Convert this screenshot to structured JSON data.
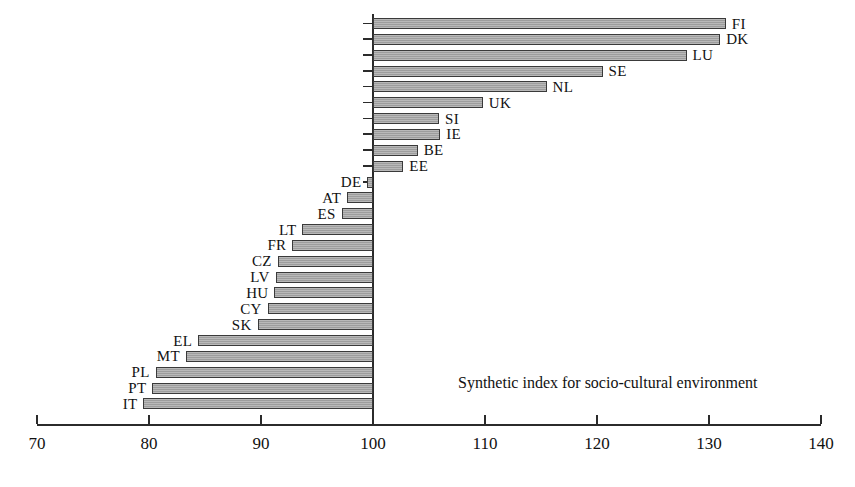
{
  "chart_data": {
    "type": "bar",
    "orientation": "horizontal",
    "title": "",
    "annotation": "Synthetic index for socio-cultural environment",
    "xlabel": "",
    "ylabel": "",
    "xlim": [
      70,
      140
    ],
    "baseline": 100,
    "grid": false,
    "legend": null,
    "xticks": [
      70,
      80,
      90,
      100,
      110,
      120,
      130,
      140
    ],
    "xtick_labels": [
      "70",
      "80",
      "90",
      "100",
      "110",
      "120",
      "130",
      "140"
    ],
    "categories": [
      "FI",
      "DK",
      "LU",
      "SE",
      "NL",
      "UK",
      "SI",
      "IE",
      "BE",
      "EE",
      "DE",
      "AT",
      "ES",
      "LT",
      "FR",
      "CZ",
      "LV",
      "HU",
      "CY",
      "SK",
      "EL",
      "MT",
      "PL",
      "PT",
      "IT"
    ],
    "values": [
      131.5,
      131.0,
      128.0,
      120.5,
      115.5,
      109.8,
      105.9,
      106.0,
      104.0,
      102.7,
      99.5,
      97.7,
      97.2,
      93.7,
      92.8,
      91.5,
      91.3,
      91.2,
      90.6,
      89.7,
      84.4,
      83.3,
      80.6,
      80.3,
      79.5
    ],
    "bars": [
      {
        "label": "FI",
        "value": 131.5,
        "label_side": "right"
      },
      {
        "label": "DK",
        "value": 131.0,
        "label_side": "right"
      },
      {
        "label": "LU",
        "value": 128.0,
        "label_side": "right"
      },
      {
        "label": "SE",
        "value": 120.5,
        "label_side": "right"
      },
      {
        "label": "NL",
        "value": 115.5,
        "label_side": "right"
      },
      {
        "label": "UK",
        "value": 109.8,
        "label_side": "right"
      },
      {
        "label": "SI",
        "value": 105.9,
        "label_side": "right"
      },
      {
        "label": "IE",
        "value": 106.0,
        "label_side": "right"
      },
      {
        "label": "BE",
        "value": 104.0,
        "label_side": "right"
      },
      {
        "label": "EE",
        "value": 102.7,
        "label_side": "right"
      },
      {
        "label": "DE",
        "value": 99.5,
        "label_side": "left"
      },
      {
        "label": "AT",
        "value": 97.7,
        "label_side": "left"
      },
      {
        "label": "ES",
        "value": 97.2,
        "label_side": "left"
      },
      {
        "label": "LT",
        "value": 93.7,
        "label_side": "left"
      },
      {
        "label": "FR",
        "value": 92.8,
        "label_side": "left"
      },
      {
        "label": "CZ",
        "value": 91.5,
        "label_side": "left"
      },
      {
        "label": "LV",
        "value": 91.3,
        "label_side": "left"
      },
      {
        "label": "HU",
        "value": 91.2,
        "label_side": "left"
      },
      {
        "label": "CY",
        "value": 90.6,
        "label_side": "left"
      },
      {
        "label": "SK",
        "value": 89.7,
        "label_side": "left"
      },
      {
        "label": "EL",
        "value": 84.4,
        "label_side": "left"
      },
      {
        "label": "MT",
        "value": 83.3,
        "label_side": "left"
      },
      {
        "label": "PL",
        "value": 80.6,
        "label_side": "left"
      },
      {
        "label": "PT",
        "value": 80.3,
        "label_side": "left"
      },
      {
        "label": "IT",
        "value": 79.5,
        "label_side": "left"
      }
    ],
    "colors": {
      "bar_fill": "#a8a8a8",
      "bar_edge": "#3a3a3a",
      "axis": "#2b2b2b",
      "text": "#111111",
      "background": "#ffffff"
    }
  }
}
